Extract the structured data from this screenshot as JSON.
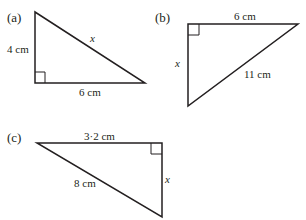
{
  "figures": [
    {
      "id": "a",
      "label": "(a)",
      "sides": {
        "vertical": "4 cm",
        "horizontal": "6 cm",
        "hypotenuse": "x"
      }
    },
    {
      "id": "b",
      "label": "(b)",
      "sides": {
        "horizontal": "6 cm",
        "vertical": "x",
        "hypotenuse": "11 cm"
      }
    },
    {
      "id": "c",
      "label": "(c)",
      "sides": {
        "horizontal": "3·2 cm",
        "vertical": "x",
        "hypotenuse": "8 cm"
      }
    }
  ],
  "colors": {
    "stroke": "#231f20",
    "background": "#ffffff"
  }
}
